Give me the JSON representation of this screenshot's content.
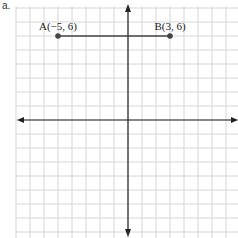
{
  "problem_label": "a.",
  "graph": {
    "x_range": [
      -8,
      8
    ],
    "y_range": [
      -8,
      8
    ],
    "grid_color": "#d6d6d6",
    "axis_color": "#222222",
    "segment_color": "#444444"
  },
  "points": [
    {
      "name": "A",
      "label": "A(−5, 6)",
      "x": -5,
      "y": 6
    },
    {
      "name": "B",
      "label": "B(3, 6)",
      "x": 3,
      "y": 6
    }
  ],
  "segments": [
    {
      "from": "A",
      "to": "B"
    }
  ]
}
